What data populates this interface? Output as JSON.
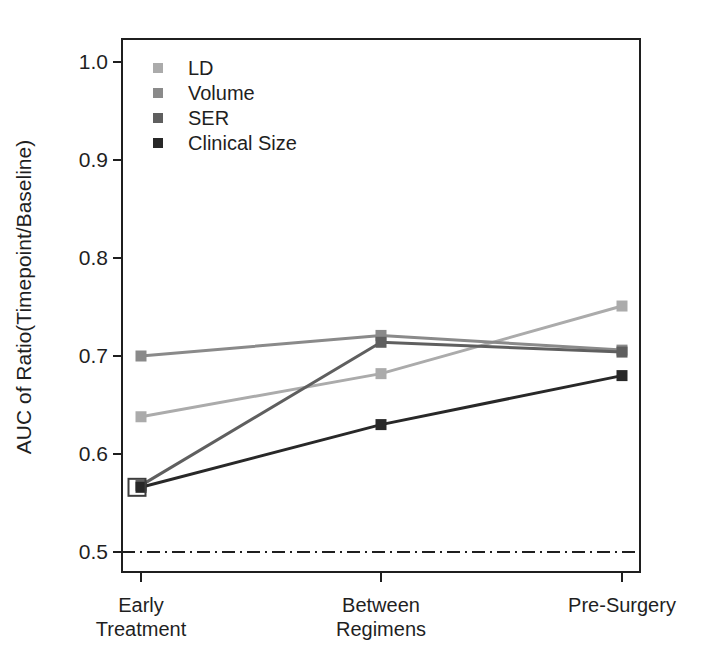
{
  "chart_data": {
    "type": "line",
    "title": "",
    "xlabel": "",
    "ylabel": "AUC of Ratio(Timepoint/Baseline)",
    "categories": [
      "Early Treatment",
      "Between Regimens",
      "Pre-Surgery"
    ],
    "category_label_lines": [
      [
        "Early",
        "Treatment"
      ],
      [
        "Between",
        "Regimens"
      ],
      [
        "Pre-Surgery"
      ]
    ],
    "ylim": [
      0.5,
      1.0
    ],
    "yticks": [
      1.0,
      0.9,
      0.8,
      0.7,
      0.6,
      0.5
    ],
    "ytick_labels": [
      "1.0",
      "0.9",
      "0.8",
      "0.7",
      "0.6",
      "0.5"
    ],
    "grid": "off",
    "marker": "filled-square",
    "legend_position": "top-left-inside",
    "legend_entries": [
      "LD",
      "Volume",
      "SER",
      "Clinical Size"
    ],
    "series": [
      {
        "name": "LD",
        "color": "#ababab",
        "values": [
          0.638,
          0.682,
          0.751
        ]
      },
      {
        "name": "Volume",
        "color": "#8a8a8a",
        "values": [
          0.7,
          0.721,
          0.706
        ]
      },
      {
        "name": "SER",
        "color": "#5f5f5f",
        "values": [
          0.568,
          0.714,
          0.704
        ]
      },
      {
        "name": "Clinical Size",
        "color": "#282828",
        "values": [
          0.566,
          0.63,
          0.68
        ]
      }
    ],
    "reference_line": {
      "y": 0.5,
      "style": "dash-dot",
      "color": "#1f1f1f"
    },
    "annotations": [
      {
        "type": "open-square-marker",
        "category": "Early Treatment",
        "value": 0.566,
        "note": "overlapping SER and Clinical Size markers"
      }
    ],
    "frame_color": "#1f1f1f",
    "text_color": "#1f1f1f"
  }
}
